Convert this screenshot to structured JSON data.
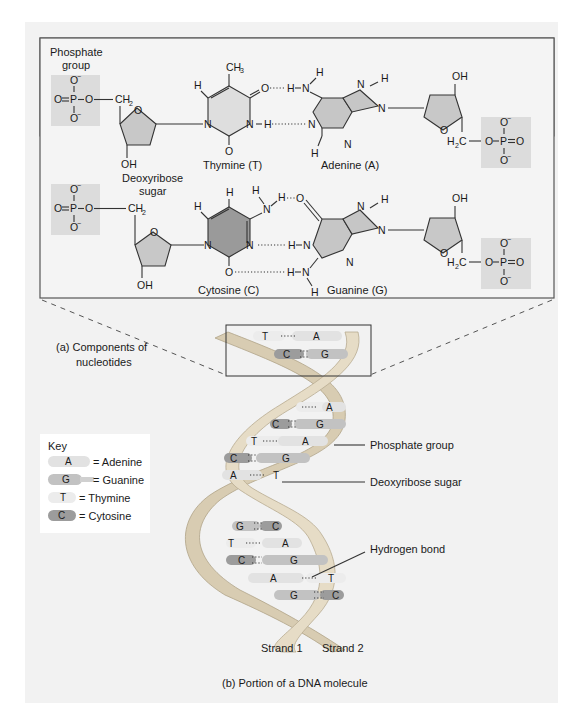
{
  "colors": {
    "panel_bg": "#f2f2f2",
    "page_bg": "#ffffff",
    "box_border": "#555555",
    "phosphate_box": "#dcdcdc",
    "sugar_fill": "#c8c8c8",
    "pyrimidine_light": "#dedede",
    "pyrimidine_dark": "#9a9a9a",
    "purine_fill": "#c6c6c6",
    "adenine_bar": "#e2e2e2",
    "guanine_bar": "#c2c2c2",
    "thymine_bar": "#ececec",
    "cytosine_bar": "#9c9c9c",
    "ribbon": "#e6dcc6"
  },
  "panel_a": {
    "caption_line1": "(a) Components of",
    "caption_line2": "nucleotides",
    "phosphate_group_label_line1": "Phosphate",
    "phosphate_group_label_line2": "group",
    "sugar_label_line1": "Deoxyribose",
    "sugar_label_line2": "sugar",
    "atoms": {
      "O": "O",
      "P": "P",
      "N": "N",
      "H": "H",
      "OH": "OH",
      "CH2": "CH",
      "CH3": "CH",
      "H2C_H": "H",
      "H2C_C": "C",
      "sub2": "2",
      "sub3": "3",
      "minus": "−"
    },
    "pair1": {
      "left_base": "Thymine (T)",
      "right_base": "Adenine (A)"
    },
    "pair2": {
      "left_base": "Cytosine (C)",
      "right_base": "Guanine (G)"
    }
  },
  "panel_b": {
    "caption": "(b) Portion of a DNA molecule",
    "callouts": {
      "phosphate_group": "Phosphate group",
      "deoxyribose_sugar": "Deoxyribose sugar",
      "hydrogen_bond": "Hydrogen bond"
    },
    "strand_1": "Strand 1",
    "strand_2": "Strand 2",
    "base_pairs": [
      {
        "left": "T",
        "right": "A"
      },
      {
        "left": "C",
        "right": "G"
      },
      {
        "left": "T",
        "right": "A"
      },
      {
        "left": "C",
        "right": "G"
      },
      {
        "left": "T",
        "right": "A"
      },
      {
        "left": "C",
        "right": "G"
      },
      {
        "left": "A",
        "right": "T"
      },
      {
        "left": "G",
        "right": "C"
      },
      {
        "left": "T",
        "right": "A"
      },
      {
        "left": "C",
        "right": "G"
      },
      {
        "left": "A",
        "right": "T"
      },
      {
        "left": "G",
        "right": "C"
      }
    ]
  },
  "key": {
    "title": "Key",
    "items": [
      {
        "letter": "A",
        "label": "= Adenine"
      },
      {
        "letter": "G",
        "label": "= Guanine"
      },
      {
        "letter": "T",
        "label": "= Thymine"
      },
      {
        "letter": "C",
        "label": "= Cytosine"
      }
    ]
  }
}
